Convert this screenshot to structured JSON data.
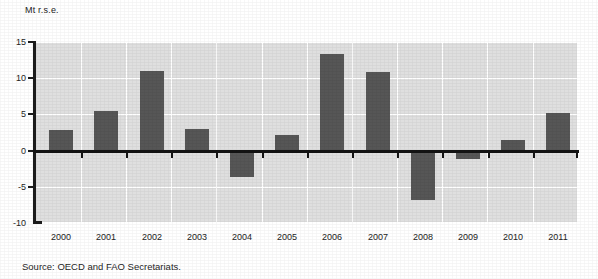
{
  "figure": {
    "y_unit_caption": "Mt r.s.e.",
    "source_note": "Source:  OECD and FAO Secretariats."
  },
  "colors": {
    "bar": "#565656",
    "plot_background": "#dfdfdf",
    "gridline": "#ffffff",
    "axis": "#1c1c1c",
    "zero_line": "#131313",
    "page_background": "#ffffff"
  },
  "chart_data": {
    "type": "bar",
    "title": "",
    "subtitle": "",
    "xlabel": "",
    "ylabel": "Mt r.s.e.",
    "categories": [
      "2000",
      "2001",
      "2002",
      "2003",
      "2004",
      "2005",
      "2006",
      "2007",
      "2008",
      "2009",
      "2010",
      "2011"
    ],
    "values": [
      2.9,
      5.5,
      11.0,
      3.0,
      -3.6,
      2.1,
      13.3,
      10.8,
      -6.8,
      -1.2,
      1.5,
      5.2
    ],
    "ylim": [
      -10,
      15
    ],
    "yticks": [
      15,
      10,
      5,
      0,
      -5,
      -10
    ],
    "ytick_labels": [
      "15",
      "10",
      "5",
      "0",
      "-5",
      "-10"
    ],
    "grid": true,
    "legend": false,
    "legend_position": "none",
    "zero_line": 0,
    "annotations": []
  }
}
